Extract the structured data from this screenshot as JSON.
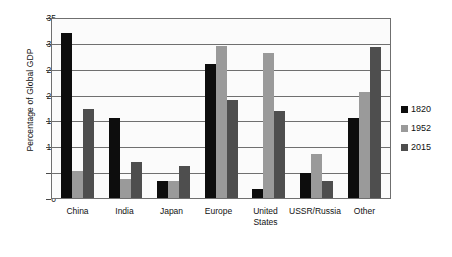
{
  "chart_data": {
    "type": "bar",
    "title": "",
    "xlabel": "",
    "ylabel": "Percentage of Global GDP",
    "categories": [
      "China",
      "India",
      "Japan",
      "Europe",
      "United States",
      "USSR/Russia",
      "Other"
    ],
    "series": [
      {
        "name": "1820",
        "color": "#0d0d0d",
        "values": [
          32.3,
          15.7,
          3.3,
          26.3,
          1.8,
          4.8,
          15.6
        ]
      },
      {
        "name": "1952",
        "color": "#9a9a9a",
        "values": [
          5.2,
          3.8,
          3.4,
          29.7,
          28.3,
          8.7,
          20.8
        ]
      },
      {
        "name": "2015",
        "color": "#4e4e4e",
        "values": [
          17.4,
          7.0,
          6.2,
          19.1,
          17.1,
          3.3,
          29.5
        ]
      }
    ],
    "ylim": [
      0,
      35
    ],
    "yticks": [
      0,
      5,
      10,
      15,
      20,
      25,
      30,
      35
    ],
    "ytick_labels": [
      "0",
      "5",
      "10",
      "15",
      "20",
      "25",
      "30",
      "35"
    ],
    "grid": true,
    "legend_position": "right"
  }
}
